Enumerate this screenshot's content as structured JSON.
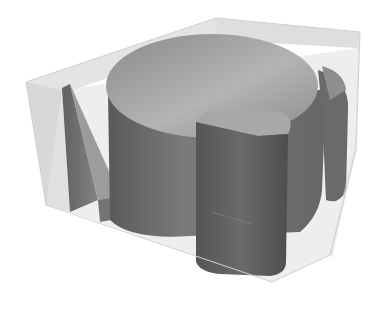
{
  "scene": {
    "description": "3D render of a translucent gray box containing dark gray solid shapes: a tall slanted prism on the left, a large elliptical cylinder with a notch, and a rounded rectangular block in front",
    "background_color": "#ffffff",
    "colors": {
      "box_face": "#d8d8d8",
      "box_edge": "#c4c4c4",
      "cylinder_top": "#9a9a9a",
      "cylinder_side": "#6e6e6e",
      "prism": "#707070",
      "block": "#5e5e5e"
    }
  }
}
